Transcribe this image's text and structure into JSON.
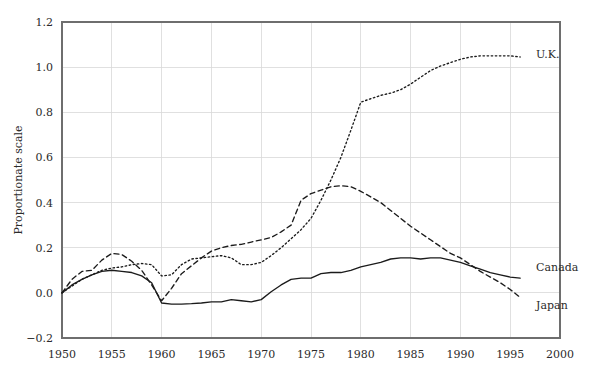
{
  "chart_data": {
    "type": "line",
    "title": "",
    "subtitle": "",
    "xlabel": "",
    "ylabel": "Proportionate scale",
    "xlim": [
      1950,
      2000
    ],
    "ylim": [
      -0.2,
      1.2
    ],
    "xticks": [
      1950,
      1955,
      1960,
      1965,
      1970,
      1975,
      1980,
      1985,
      1990,
      1995,
      2000
    ],
    "yticks": [
      -0.2,
      0.0,
      0.2,
      0.4,
      0.6,
      0.8,
      1.0,
      1.2
    ],
    "xtick_labels": [
      "1950",
      "1955",
      "1960",
      "1965",
      "1970",
      "1975",
      "1980",
      "1985",
      "1990",
      "1995",
      "2000"
    ],
    "ytick_labels": [
      "−0.2",
      "0.0",
      "0.2",
      "0.4",
      "0.6",
      "0.8",
      "1.0",
      "1.2"
    ],
    "grid": true,
    "grid_axis": "both",
    "legend": "inline-end-labels",
    "color": "#1b1b1b",
    "series": [
      {
        "name": "U.K.",
        "label": "U.K.",
        "dash": "dotted",
        "dasharray": "1.5 2.6",
        "label_x": 1997.6,
        "label_y": 1.06,
        "x": [
          1950,
          1951,
          1952,
          1953,
          1954,
          1955,
          1956,
          1957,
          1958,
          1959,
          1960,
          1961,
          1962,
          1963,
          1964,
          1965,
          1966,
          1967,
          1968,
          1969,
          1970,
          1971,
          1972,
          1973,
          1974,
          1975,
          1976,
          1977,
          1978,
          1979,
          1980,
          1981,
          1982,
          1983,
          1984,
          1985,
          1986,
          1987,
          1988,
          1989,
          1990,
          1991,
          1992,
          1993,
          1994,
          1995,
          1996
        ],
        "y": [
          0.0,
          0.03,
          0.06,
          0.08,
          0.1,
          0.11,
          0.115,
          0.125,
          0.13,
          0.125,
          0.075,
          0.08,
          0.125,
          0.15,
          0.155,
          0.16,
          0.165,
          0.155,
          0.125,
          0.125,
          0.135,
          0.165,
          0.2,
          0.24,
          0.28,
          0.33,
          0.41,
          0.5,
          0.6,
          0.72,
          0.845,
          0.86,
          0.875,
          0.885,
          0.9,
          0.925,
          0.955,
          0.985,
          1.005,
          1.02,
          1.035,
          1.045,
          1.05,
          1.05,
          1.05,
          1.05,
          1.045
        ]
      },
      {
        "name": "Japan",
        "label": "Japan",
        "dash": "dashed",
        "dasharray": "5 3.5",
        "label_x": 1997.6,
        "label_y": -0.055,
        "x": [
          1950,
          1951,
          1952,
          1953,
          1954,
          1955,
          1956,
          1957,
          1958,
          1959,
          1960,
          1961,
          1962,
          1963,
          1964,
          1965,
          1966,
          1967,
          1968,
          1969,
          1970,
          1971,
          1972,
          1973,
          1974,
          1975,
          1976,
          1977,
          1978,
          1979,
          1980,
          1981,
          1982,
          1983,
          1984,
          1985,
          1986,
          1987,
          1988,
          1989,
          1990,
          1991,
          1992,
          1993,
          1994,
          1995,
          1996
        ],
        "y": [
          0.0,
          0.06,
          0.095,
          0.1,
          0.145,
          0.175,
          0.17,
          0.14,
          0.1,
          0.035,
          -0.035,
          0.02,
          0.085,
          0.12,
          0.155,
          0.185,
          0.2,
          0.21,
          0.215,
          0.225,
          0.235,
          0.245,
          0.27,
          0.3,
          0.41,
          0.44,
          0.455,
          0.47,
          0.475,
          0.47,
          0.45,
          0.425,
          0.4,
          0.365,
          0.33,
          0.295,
          0.265,
          0.235,
          0.205,
          0.175,
          0.155,
          0.125,
          0.095,
          0.07,
          0.045,
          0.015,
          -0.02
        ]
      },
      {
        "name": "Canada",
        "label": "Canada",
        "dash": "solid",
        "dasharray": "",
        "label_x": 1997.6,
        "label_y": 0.115,
        "x": [
          1950,
          1951,
          1952,
          1953,
          1954,
          1955,
          1956,
          1957,
          1958,
          1959,
          1960,
          1961,
          1962,
          1963,
          1964,
          1965,
          1966,
          1967,
          1968,
          1969,
          1970,
          1971,
          1972,
          1973,
          1974,
          1975,
          1976,
          1977,
          1978,
          1979,
          1980,
          1981,
          1982,
          1983,
          1984,
          1985,
          1986,
          1987,
          1988,
          1989,
          1990,
          1991,
          1992,
          1993,
          1994,
          1995,
          1996
        ],
        "y": [
          0.0,
          0.035,
          0.06,
          0.08,
          0.095,
          0.1,
          0.095,
          0.09,
          0.075,
          0.045,
          -0.045,
          -0.05,
          -0.05,
          -0.048,
          -0.045,
          -0.04,
          -0.04,
          -0.03,
          -0.035,
          -0.04,
          -0.03,
          0.005,
          0.035,
          0.06,
          0.065,
          0.065,
          0.085,
          0.09,
          0.09,
          0.1,
          0.115,
          0.125,
          0.135,
          0.15,
          0.155,
          0.155,
          0.15,
          0.155,
          0.155,
          0.145,
          0.135,
          0.12,
          0.105,
          0.09,
          0.08,
          0.07,
          0.065
        ]
      }
    ]
  }
}
